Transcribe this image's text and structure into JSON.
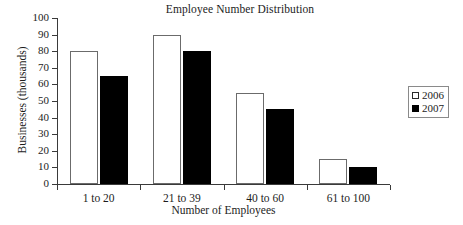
{
  "chart_data": {
    "type": "bar",
    "title": "Employee Number Distribution",
    "xlabel": "Number of Employees",
    "ylabel": "Businesses (thousands)",
    "categories": [
      "1 to 20",
      "21 to 39",
      "40 to 60",
      "61 to 100"
    ],
    "series": [
      {
        "name": "2006",
        "color": "#ffffff",
        "values": [
          80,
          90,
          55,
          15
        ]
      },
      {
        "name": "2007",
        "color": "#000000",
        "values": [
          65,
          80,
          45,
          10
        ]
      }
    ],
    "ylim": [
      0,
      100
    ],
    "yticks": [
      0,
      10,
      20,
      30,
      40,
      50,
      60,
      70,
      80,
      90,
      100
    ],
    "ytick_labels": [
      "0",
      "10",
      "20",
      "30",
      "40",
      "50",
      "60",
      "70",
      "80",
      "90",
      "100"
    ],
    "grid": false,
    "legend_position": "right"
  },
  "legend": {
    "entries": [
      {
        "label": "2006",
        "swatch": "open-square-icon"
      },
      {
        "label": "2007",
        "swatch": "filled-square-icon"
      }
    ]
  }
}
